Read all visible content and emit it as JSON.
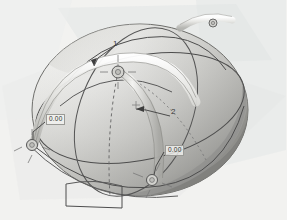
{
  "viewport": {
    "name": "3d-model-viewport",
    "background_color": "#f2f2f0",
    "model_color": "#e8e8e6",
    "shadow_color": "#8d8d8a",
    "line_color": "#4d4d4d",
    "plane_color": "#e0e3e3"
  },
  "annotations": {
    "dimension_left": {
      "value": "0.00",
      "x": 47,
      "y": 118
    },
    "dimension_right": {
      "value": "0.00",
      "x": 166,
      "y": 148
    },
    "callout_one": {
      "value": "1",
      "x": 113,
      "y": 44
    },
    "callout_two": {
      "value": "2",
      "x": 171,
      "y": 112
    }
  },
  "handles": [
    {
      "name": "handle-center",
      "x": 118,
      "y": 72,
      "r": 6
    },
    {
      "name": "handle-left",
      "x": 32,
      "y": 145,
      "r": 5
    },
    {
      "name": "handle-bottom-right",
      "x": 152,
      "y": 180,
      "r": 5
    },
    {
      "name": "handle-top-right",
      "x": 213,
      "y": 23,
      "r": 4
    }
  ],
  "geometry": {
    "sphere_label": "shaded-ellipsoid-body",
    "band_label": "sweep-band-arc",
    "curve_label": "construction-curve",
    "plane_label": "reference-plane"
  }
}
